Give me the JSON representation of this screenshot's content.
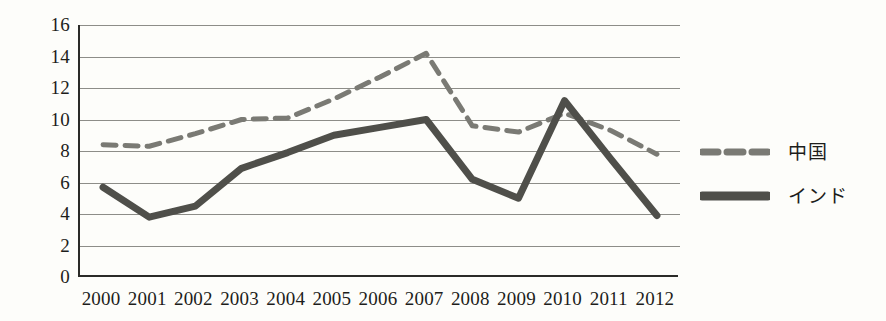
{
  "chart_data": {
    "type": "line",
    "title": "",
    "subtitle": "",
    "xlabel": "",
    "ylabel": "",
    "categories": [
      "2000",
      "2001",
      "2002",
      "2003",
      "2004",
      "2005",
      "2006",
      "2007",
      "2008",
      "2009",
      "2010",
      "2011",
      "2012"
    ],
    "x": [
      2000,
      2001,
      2002,
      2003,
      2004,
      2005,
      2006,
      2007,
      2008,
      2009,
      2010,
      2011,
      2012
    ],
    "series": [
      {
        "name": "中国",
        "style": "dashed",
        "color": "#7a7a74",
        "values": [
          8.4,
          8.3,
          9.1,
          10.0,
          10.1,
          11.3,
          12.7,
          14.2,
          9.6,
          9.2,
          10.4,
          9.3,
          7.8
        ]
      },
      {
        "name": "インド",
        "style": "solid",
        "color": "#4f4f4a",
        "values": [
          5.7,
          3.8,
          4.5,
          6.9,
          7.9,
          9.0,
          9.5,
          10.0,
          6.2,
          5.0,
          11.2,
          7.5,
          3.9
        ]
      }
    ],
    "legend": {
      "position": "right",
      "entries": [
        {
          "label": "中国",
          "style": "dashed",
          "color": "#7a7a74"
        },
        {
          "label": "インド",
          "style": "solid",
          "color": "#4f4f4a"
        }
      ]
    },
    "yaxis": {
      "min": 0,
      "max": 16,
      "step": 2,
      "ticks": [
        "0",
        "2",
        "4",
        "6",
        "8",
        "10",
        "12",
        "14",
        "16"
      ]
    },
    "grid": {
      "horizontal": true,
      "vertical": false,
      "color": "#8d8d88"
    },
    "axis_color": "#2b2b28",
    "background": "#fdfdfa"
  }
}
